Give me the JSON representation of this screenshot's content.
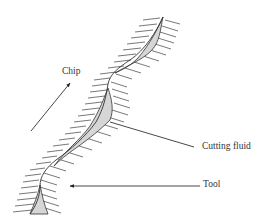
{
  "diagram": {
    "type": "cutting-tool-chip-interface",
    "labels": {
      "chip": "Chip",
      "cutting_fluid": "Cutting fluid",
      "tool": "Tool"
    },
    "colors": {
      "line": "#333333",
      "hatch": "#555555",
      "fluid_fill": "#d6d6d6",
      "background": "#ffffff"
    }
  }
}
